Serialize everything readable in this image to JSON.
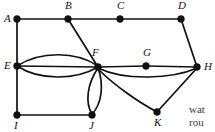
{
  "figure": {
    "type": "undirected-multigraph",
    "width": 215,
    "height": 132,
    "background": "#ffffff",
    "ink_color": "#111111"
  },
  "graph": {
    "vertices": [
      {
        "id": "A",
        "label": "A",
        "x": 17,
        "y": 19,
        "label_pos": "left"
      },
      {
        "id": "B",
        "label": "B",
        "x": 68,
        "y": 19,
        "label_pos": "above"
      },
      {
        "id": "C",
        "label": "C",
        "x": 120,
        "y": 19,
        "label_pos": "above"
      },
      {
        "id": "D",
        "label": "D",
        "x": 181,
        "y": 19,
        "label_pos": "above"
      },
      {
        "id": "E",
        "label": "E",
        "x": 17,
        "y": 66,
        "label_pos": "left"
      },
      {
        "id": "F",
        "label": "F",
        "x": 98,
        "y": 67,
        "label_pos": "above-left"
      },
      {
        "id": "G",
        "label": "G",
        "x": 146,
        "y": 66,
        "label_pos": "above"
      },
      {
        "id": "H",
        "label": "H",
        "x": 197,
        "y": 67,
        "label_pos": "right"
      },
      {
        "id": "I",
        "label": "I",
        "x": 17,
        "y": 115,
        "label_pos": "below"
      },
      {
        "id": "J",
        "label": "J",
        "x": 92,
        "y": 115,
        "label_pos": "below"
      },
      {
        "id": "K",
        "label": "K",
        "x": 157,
        "y": 112,
        "label_pos": "below"
      }
    ],
    "edges": [
      {
        "from": "A",
        "to": "B",
        "shape": "straight"
      },
      {
        "from": "B",
        "to": "C",
        "shape": "straight"
      },
      {
        "from": "C",
        "to": "D",
        "shape": "straight"
      },
      {
        "from": "A",
        "to": "E",
        "shape": "straight"
      },
      {
        "from": "E",
        "to": "I",
        "shape": "straight"
      },
      {
        "from": "B",
        "to": "F",
        "shape": "straight"
      },
      {
        "from": "D",
        "to": "H",
        "shape": "straight"
      },
      {
        "from": "E",
        "to": "F",
        "shape": "curve-up"
      },
      {
        "from": "E",
        "to": "F",
        "shape": "straight"
      },
      {
        "from": "E",
        "to": "F",
        "shape": "curve-down"
      },
      {
        "from": "F",
        "to": "G",
        "shape": "straight"
      },
      {
        "from": "G",
        "to": "H",
        "shape": "straight"
      },
      {
        "from": "F",
        "to": "H",
        "shape": "curve-down"
      },
      {
        "from": "F",
        "to": "J",
        "shape": "curve-left"
      },
      {
        "from": "F",
        "to": "J",
        "shape": "curve-right"
      },
      {
        "from": "I",
        "to": "J",
        "shape": "straight"
      },
      {
        "from": "F",
        "to": "K",
        "shape": "curve-down"
      },
      {
        "from": "K",
        "to": "H",
        "shape": "straight"
      }
    ],
    "edge_paths": [
      {
        "name": "edge-A-B",
        "d": "M 17 19 L 68 19"
      },
      {
        "name": "edge-B-C",
        "d": "M 68 19 L 120 19"
      },
      {
        "name": "edge-C-D",
        "d": "M 120 19 L 181 19"
      },
      {
        "name": "edge-A-E",
        "d": "M 17 19 L 17 66"
      },
      {
        "name": "edge-E-I",
        "d": "M 17 66 L 17 115"
      },
      {
        "name": "edge-B-F",
        "d": "M 68 19 L 98 67"
      },
      {
        "name": "edge-D-H",
        "d": "M 181 19 L 197 67"
      },
      {
        "name": "edge-E-F-upper",
        "d": "M 17 66 C 40 51, 76 51, 98 66"
      },
      {
        "name": "edge-E-F-middle",
        "d": "M 17 66 L 98 67"
      },
      {
        "name": "edge-E-F-lower",
        "d": "M 17 66 C 40 81, 76 80, 98 67"
      },
      {
        "name": "edge-F-G",
        "d": "M 98 67 L 146 66"
      },
      {
        "name": "edge-G-H",
        "d": "M 146 66 L 197 67"
      },
      {
        "name": "edge-F-H-lower",
        "d": "M 98 68 C 125 81, 172 79, 197 68"
      },
      {
        "name": "edge-F-J-left",
        "d": "M 98 68 C 87 84, 85 103, 92 114"
      },
      {
        "name": "edge-F-J-right",
        "d": "M 98 68 C 104 84, 102 104, 92 114"
      },
      {
        "name": "edge-I-J",
        "d": "M 17 115 L 92 115"
      },
      {
        "name": "edge-F-K",
        "d": "M 98 69 C 115 86, 140 103, 157 112"
      },
      {
        "name": "edge-K-H",
        "d": "M 157 112 L 197 68"
      }
    ]
  },
  "page_text": {
    "lines": [
      "wat",
      "rou"
    ]
  }
}
